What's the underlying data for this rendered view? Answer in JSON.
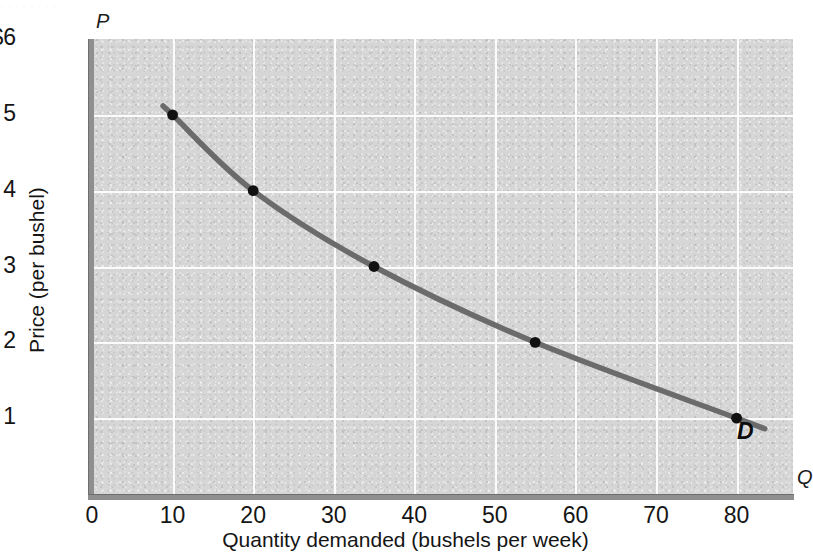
{
  "figure": {
    "top_residue_text": "· ·   ·      ·     ·        ·   ·     ·",
    "curve_label": "D",
    "y_axis_letter": "P",
    "x_axis_letter": "Q"
  },
  "chart_data": {
    "type": "line",
    "title": "",
    "xlabel": "Quantity demanded (bushels per week)",
    "ylabel": "Price (per bushel)",
    "xlim": [
      0,
      87
    ],
    "ylim": [
      0,
      6
    ],
    "grid": true,
    "legend_position": "inline-curve-end",
    "x_ticks": [
      "0",
      "10",
      "20",
      "30",
      "40",
      "50",
      "60",
      "70",
      "80"
    ],
    "x_tick_values": [
      0,
      10,
      20,
      30,
      40,
      50,
      60,
      70,
      80
    ],
    "y_ticks": [
      "1",
      "2",
      "3",
      "4",
      "5",
      "$6"
    ],
    "y_tick_values": [
      1,
      2,
      3,
      4,
      5,
      6
    ],
    "series": [
      {
        "name": "D",
        "label": "D",
        "color": "#6b6b6b",
        "marker_color": "#111111",
        "x": [
          10,
          20,
          35,
          55,
          80
        ],
        "y": [
          5,
          4,
          3,
          2,
          1
        ],
        "points": [
          {
            "q": 10,
            "p": 5
          },
          {
            "q": 20,
            "p": 4
          },
          {
            "q": 35,
            "p": 3
          },
          {
            "q": 55,
            "p": 2
          },
          {
            "q": 80,
            "p": 1
          }
        ]
      }
    ],
    "colors": {
      "plot_background": "#d6d6d6",
      "gridline": "#fbfbfb",
      "axis": "#8f8f8f",
      "curve": "#6b6b6b",
      "marker": "#111111",
      "text": "#151515"
    }
  }
}
